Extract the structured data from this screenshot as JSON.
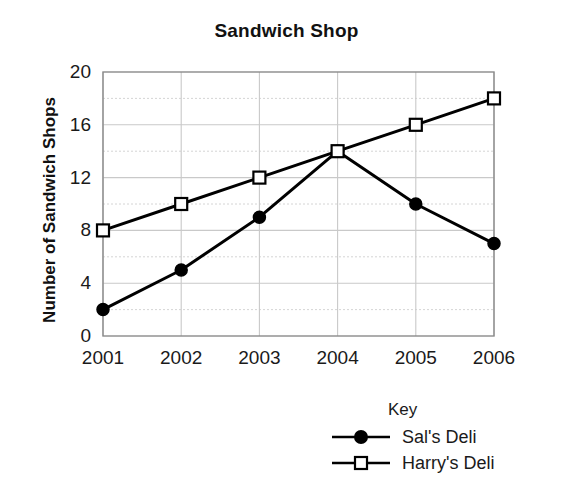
{
  "chart_data": {
    "type": "line",
    "title": "Sandwich Shop",
    "xlabel": "",
    "ylabel": "Number of Sandwich Shops",
    "categories": [
      "2001",
      "2002",
      "2003",
      "2004",
      "2005",
      "2006"
    ],
    "series": [
      {
        "name": "Sal's Deli",
        "marker": "filled-circle",
        "values": [
          2,
          5,
          9,
          14,
          10,
          7
        ]
      },
      {
        "name": "Harry's Deli",
        "marker": "open-square",
        "values": [
          8,
          10,
          12,
          14,
          16,
          18
        ]
      }
    ],
    "ylim": [
      0,
      20
    ],
    "y_ticks": [
      0,
      4,
      8,
      12,
      16,
      20
    ],
    "y_minor_step": 2,
    "grid": true,
    "legend_position": "below-right",
    "legend_title": "Key",
    "colors": {
      "line": "#000000",
      "grid": "#c9c9c9",
      "axis": "#8a8a8a",
      "background": "#ffffff"
    }
  }
}
